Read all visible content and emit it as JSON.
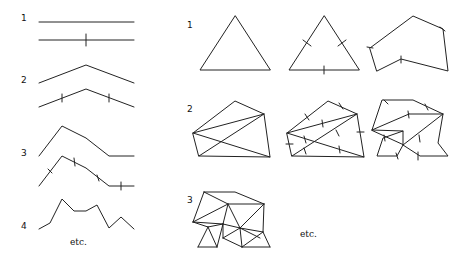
{
  "figure": {
    "left_panel": {
      "title": "Koch-like line subdivision",
      "levels": [
        {
          "label": "1",
          "stroke": "#222222"
        },
        {
          "label": "2",
          "stroke": "#222222"
        },
        {
          "label": "3",
          "stroke": "#222222"
        },
        {
          "label": "4",
          "stroke": "#222222"
        }
      ],
      "etc_label": "etc."
    },
    "right_panel": {
      "title": "Triangle / polygon subdivision",
      "levels": [
        {
          "label": "1"
        },
        {
          "label": "2"
        },
        {
          "label": "3"
        }
      ],
      "etc_label": "etc."
    },
    "colors": {
      "line": "#222222",
      "background": "#ffffff"
    }
  }
}
